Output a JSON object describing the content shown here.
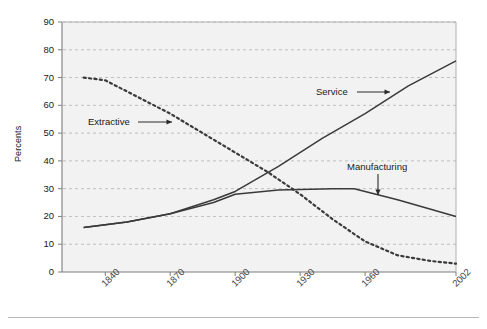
{
  "axes": {
    "ylabel": "Percents",
    "yticks": [
      "0",
      "10",
      "20",
      "30",
      "40",
      "50",
      "60",
      "70",
      "80",
      "90"
    ],
    "xticks": [
      "1840",
      "1870",
      "1900",
      "1930",
      "1960",
      "2002"
    ]
  },
  "annotations": {
    "extractive": "Extractive",
    "service": "Service",
    "manufacturing": "Manufacturing"
  },
  "colors": {
    "plot_background": "#f2f2f2",
    "gridline": "#9a9aa5",
    "axis": "#8a8a8a",
    "line": "#3a3a3a",
    "text": "#1a1a1a"
  },
  "chart_data": {
    "type": "line",
    "title": "",
    "xlabel": "",
    "ylabel": "Percents",
    "xlim": [
      1820,
      2002
    ],
    "ylim": [
      0,
      90
    ],
    "grid": true,
    "legend": "inline-annotations",
    "xticklabels": [
      "1840",
      "1870",
      "1900",
      "1930",
      "1960",
      "2002"
    ],
    "yticklabels": [
      "0",
      "10",
      "20",
      "30",
      "40",
      "50",
      "60",
      "70",
      "80",
      "90"
    ],
    "series": [
      {
        "name": "Extractive",
        "style": "dotted",
        "x": [
          1830,
          1840,
          1855,
          1870,
          1885,
          1900,
          1915,
          1930,
          1945,
          1960,
          1975,
          1990,
          2002
        ],
        "values": [
          70,
          69,
          63,
          57,
          50,
          43,
          36,
          28,
          19,
          11,
          6,
          4,
          3
        ]
      },
      {
        "name": "Service",
        "style": "solid",
        "x": [
          1830,
          1850,
          1870,
          1890,
          1900,
          1920,
          1940,
          1960,
          1980,
          2002
        ],
        "values": [
          16,
          18,
          21,
          26,
          29,
          38,
          48,
          57,
          67,
          76
        ]
      },
      {
        "name": "Manufacturing",
        "style": "solid",
        "x": [
          1830,
          1850,
          1870,
          1890,
          1900,
          1920,
          1945,
          1955,
          1975,
          2002
        ],
        "values": [
          16,
          18,
          21,
          25,
          28,
          29.5,
          30,
          30,
          26,
          20
        ]
      }
    ]
  }
}
